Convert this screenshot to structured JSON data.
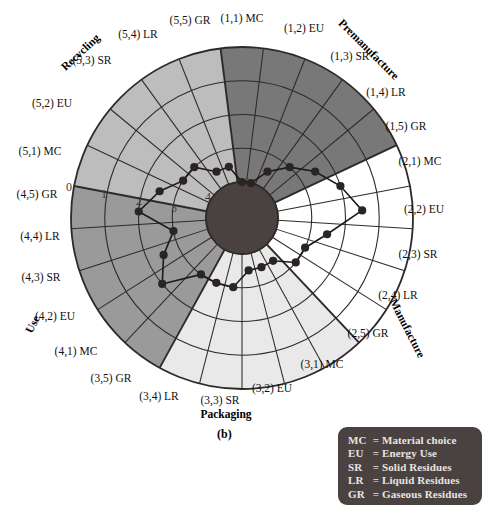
{
  "figure": {
    "caption": "(b)",
    "center_radius_px": 36,
    "outer_radius_px": 171
  },
  "scale": {
    "name": "radial-scale",
    "ticks": [
      "0",
      "1",
      "2",
      "3",
      "4"
    ],
    "direction": "0 at outer rim, 4 at center"
  },
  "stages": [
    {
      "id": 1,
      "name": "Premanufacture",
      "fill": "#787878"
    },
    {
      "id": 2,
      "name": "Manufacture",
      "fill": "#ffffff"
    },
    {
      "id": 3,
      "name": "Packaging",
      "fill": "#e9e9e9"
    },
    {
      "id": 4,
      "name": "Use",
      "fill": "#9a9a9a"
    },
    {
      "id": 5,
      "name": "Recycling",
      "fill": "#bdbdbd"
    }
  ],
  "legend": {
    "title": "abbreviations",
    "rows": [
      {
        "abbr": "MC",
        "eq": "=",
        "desc": "Material choice"
      },
      {
        "abbr": "EU",
        "eq": "=",
        "desc": "Energy Use"
      },
      {
        "abbr": "SR",
        "eq": "=",
        "desc": "Solid Residues"
      },
      {
        "abbr": "LR",
        "eq": "=",
        "desc": "Liquid Residues"
      },
      {
        "abbr": "GR",
        "eq": "=",
        "desc": "Gaseous Residues"
      }
    ]
  },
  "chart_data": {
    "type": "radar",
    "xlabel": "",
    "ylabel": "",
    "rlim": [
      0,
      4
    ],
    "grid": true,
    "legend_position": "bottom-right",
    "note": "25 cells: 5 life-cycle stages x 5 environmental concerns. Radial value 0 at rim, 4 at hub.",
    "categories": [
      "(1,1) MC",
      "(1,2) EU",
      "(1,3) SR",
      "(1,4) LR",
      "(1,5) GR",
      "(2,1) MC",
      "(2,2) EU",
      "(2,3) SR",
      "(2,4) LR",
      "(2,5) GR",
      "(3,1) MC",
      "(3,2) EU",
      "(3,3) SR",
      "(3,4) LR",
      "(3,5) GR",
      "(4,1) MC",
      "(4,2) EU",
      "(4,3) SR",
      "(4,4) LR",
      "(4,5) GR",
      "(5,1) MC",
      "(5,2) EU",
      "(5,3) SR",
      "(5,4) LR",
      "(5,5) GR"
    ],
    "values": [
      4,
      4,
      3.5,
      3,
      2.5,
      2,
      1.5,
      2.5,
      3,
      3,
      3.5,
      3.5,
      3.5,
      3,
      3,
      3,
      2,
      2.5,
      3,
      2,
      2.5,
      3,
      3,
      3.5,
      3.5
    ],
    "series": [
      {
        "name": "assessment score",
        "values": [
          4,
          4,
          3.5,
          3,
          2.5,
          2,
          1.5,
          2.5,
          3,
          3,
          3.5,
          3.5,
          3.5,
          3,
          3,
          3,
          2,
          2.5,
          3,
          2,
          2.5,
          3,
          3,
          3.5,
          3.5
        ]
      }
    ]
  },
  "sector_labels": [
    {
      "text": "(1,1) MC",
      "x": 242,
      "y": 22,
      "anchor": "middle",
      "rot": 0
    },
    {
      "text": "(1,2) EU",
      "x": 304,
      "y": 32,
      "anchor": "middle",
      "rot": 0
    },
    {
      "text": "(1,3) SR",
      "x": 350,
      "y": 60,
      "anchor": "middle",
      "rot": 0
    },
    {
      "text": "(1,4) LR",
      "x": 386,
      "y": 96,
      "anchor": "middle",
      "rot": 0
    },
    {
      "text": "(1,5) GR",
      "x": 406,
      "y": 130,
      "anchor": "middle",
      "rot": 0
    },
    {
      "text": "(2,1) MC",
      "x": 420,
      "y": 165,
      "anchor": "middle",
      "rot": 0
    },
    {
      "text": "(2,2) EU",
      "x": 424,
      "y": 213,
      "anchor": "middle",
      "rot": 0
    },
    {
      "text": "(2,3) SR",
      "x": 418,
      "y": 258,
      "anchor": "middle",
      "rot": 0
    },
    {
      "text": "(2,4) LR",
      "x": 398,
      "y": 299,
      "anchor": "middle",
      "rot": 0
    },
    {
      "text": "(2,5) GR",
      "x": 368,
      "y": 337,
      "anchor": "middle",
      "rot": 0
    },
    {
      "text": "(3,1) MC",
      "x": 322,
      "y": 368,
      "anchor": "middle",
      "rot": 0
    },
    {
      "text": "(3,2) EU",
      "x": 272,
      "y": 392,
      "anchor": "middle",
      "rot": 0
    },
    {
      "text": "(3,3) SR",
      "x": 220,
      "y": 404,
      "anchor": "middle",
      "rot": 0
    },
    {
      "text": "(3,4) LR",
      "x": 159,
      "y": 400,
      "anchor": "middle",
      "rot": 0
    },
    {
      "text": "(3,5) GR",
      "x": 111,
      "y": 382,
      "anchor": "middle",
      "rot": 0
    },
    {
      "text": "(4,1) MC",
      "x": 76,
      "y": 355,
      "anchor": "middle",
      "rot": 0
    },
    {
      "text": "(4,2) EU",
      "x": 55,
      "y": 320,
      "anchor": "middle",
      "rot": 0
    },
    {
      "text": "(4,3) SR",
      "x": 41,
      "y": 281,
      "anchor": "middle",
      "rot": 0
    },
    {
      "text": "(4,4) LR",
      "x": 40,
      "y": 240,
      "anchor": "middle",
      "rot": 0
    },
    {
      "text": "(4,5) GR",
      "x": 37,
      "y": 198,
      "anchor": "middle",
      "rot": 0
    },
    {
      "text": "(5,1) MC",
      "x": 40,
      "y": 155,
      "anchor": "middle",
      "rot": 0
    },
    {
      "text": "(5,2) EU",
      "x": 52,
      "y": 107,
      "anchor": "middle",
      "rot": 0
    },
    {
      "text": "(5,3) SR",
      "x": 92,
      "y": 64,
      "anchor": "middle",
      "rot": 0
    },
    {
      "text": "(5,4) LR",
      "x": 138,
      "y": 38,
      "anchor": "middle",
      "rot": 0
    },
    {
      "text": "(5,5) GR",
      "x": 190,
      "y": 24,
      "anchor": "middle",
      "rot": 0
    }
  ],
  "stage_labels": [
    {
      "text": "Premanufacture",
      "x": 366,
      "y": 52,
      "rot": 45
    },
    {
      "text": "Manufacture",
      "x": 404,
      "y": 330,
      "rot": 63
    },
    {
      "text": "Packaging",
      "x": 226,
      "y": 418,
      "rot": 0
    },
    {
      "text": "Use",
      "x": 36,
      "y": 326,
      "rot": -62
    },
    {
      "text": "Recycling",
      "x": 83,
      "y": 55,
      "rot": -43
    }
  ],
  "tick_labels": [
    {
      "text": "0",
      "x": 69,
      "y": 191
    },
    {
      "text": "1",
      "x": 104,
      "y": 198
    },
    {
      "text": "2",
      "x": 139,
      "y": 205
    },
    {
      "text": "3",
      "x": 174,
      "y": 212
    },
    {
      "text": "4",
      "x": 208,
      "y": 201
    }
  ]
}
